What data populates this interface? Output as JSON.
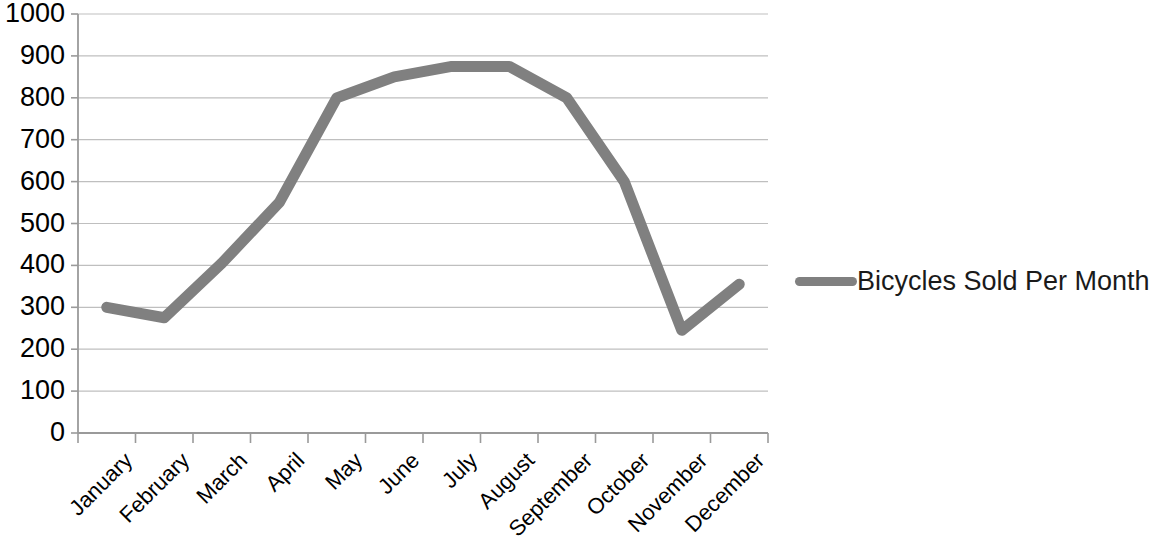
{
  "chart_data": {
    "type": "line",
    "title": "",
    "xlabel": "",
    "ylabel": "",
    "categories": [
      "January",
      "February",
      "March",
      "April",
      "May",
      "June",
      "July",
      "August",
      "September",
      "October",
      "November",
      "December"
    ],
    "series": [
      {
        "name": "Bicycles Sold Per Month",
        "values": [
          300,
          275,
          405,
          550,
          800,
          850,
          875,
          875,
          800,
          600,
          245,
          355
        ],
        "color": "#808080"
      }
    ],
    "ylim": [
      0,
      1000
    ],
    "ytick_labels": [
      "0",
      "100",
      "200",
      "300",
      "400",
      "500",
      "600",
      "700",
      "800",
      "900",
      "1000"
    ],
    "ytick_values": [
      0,
      100,
      200,
      300,
      400,
      500,
      600,
      700,
      800,
      900,
      1000
    ],
    "grid": true,
    "grid_axis": "y",
    "grid_color": "#bfbfbf",
    "axis_color": "#9a9a9a",
    "legend": true,
    "legend_position": "right"
  },
  "legend": {
    "entries": [
      {
        "label": "Bicycles Sold Per Month"
      }
    ]
  }
}
